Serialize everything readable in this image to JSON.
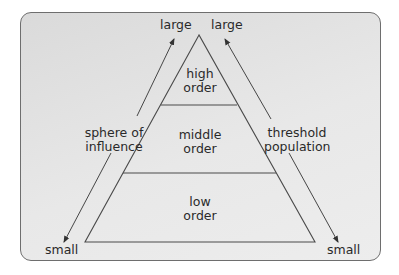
{
  "diagram": {
    "type": "central-place-hierarchy-pyramid",
    "levels": [
      {
        "line1": "high",
        "line2": "order"
      },
      {
        "line1": "middle",
        "line2": "order"
      },
      {
        "line1": "low",
        "line2": "order"
      }
    ],
    "left_axis": {
      "label_line1": "sphere of",
      "label_line2": "influence",
      "top": "large",
      "bottom": "small"
    },
    "right_axis": {
      "label_line1": "threshold",
      "label_line2": "population",
      "top": "large",
      "bottom": "small"
    },
    "colors": {
      "panel_bg": "#e3e3e3",
      "line": "#4a4a4a",
      "text": "#2a2a2a"
    }
  }
}
